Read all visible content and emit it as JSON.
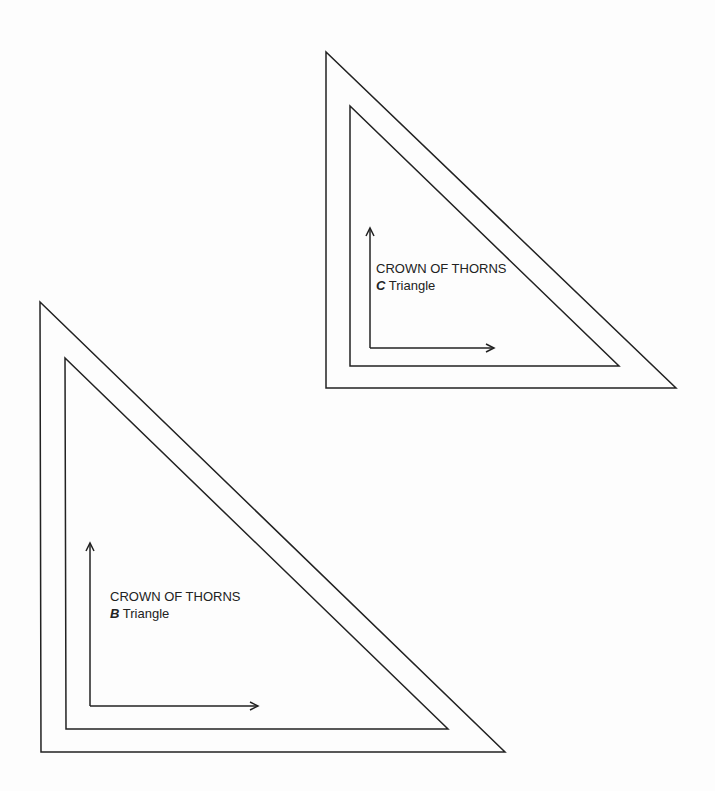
{
  "diagram": {
    "line_color": "#222222",
    "background": "#fdfdfd",
    "triangles": [
      {
        "id": "C",
        "title": "CROWN OF THORNS",
        "letter": "C",
        "subtitle": "Triangle",
        "outer": [
          [
            326,
            52
          ],
          [
            326,
            388
          ],
          [
            676,
            388
          ]
        ],
        "inner": [
          [
            350,
            106
          ],
          [
            350,
            366
          ],
          [
            619,
            366
          ]
        ],
        "arrow_corner": [
          370,
          348
        ],
        "arrow_up_end": [
          370,
          228
        ],
        "arrow_right_end": [
          494,
          348
        ],
        "label_pos": [
          376,
          260
        ]
      },
      {
        "id": "B",
        "title": "CROWN OF THORNS",
        "letter": "B",
        "subtitle": "Triangle",
        "outer": [
          [
            40,
            302
          ],
          [
            41,
            752
          ],
          [
            505,
            752
          ]
        ],
        "inner": [
          [
            65,
            358
          ],
          [
            66,
            729
          ],
          [
            448,
            729
          ]
        ],
        "arrow_corner": [
          90,
          706
        ],
        "arrow_up_end": [
          90,
          543
        ],
        "arrow_right_end": [
          258,
          706
        ],
        "label_pos": [
          110,
          588
        ]
      }
    ]
  }
}
